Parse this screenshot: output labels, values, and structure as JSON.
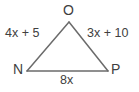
{
  "figure": {
    "type": "triangle-geometry-diagram",
    "stroke_color": "#6b6b6b",
    "text_color": "#404040",
    "background_color": "#ffffff",
    "vertices": [
      {
        "name": "O",
        "label": "O",
        "x": 69,
        "y": 22,
        "position": "apex-top"
      },
      {
        "name": "N",
        "label": "N",
        "x": 27,
        "y": 71,
        "position": "bottom-left"
      },
      {
        "name": "P",
        "label": "P",
        "x": 108,
        "y": 71,
        "position": "bottom-right"
      }
    ],
    "sides": [
      {
        "name": "ON",
        "from": "O",
        "to": "N",
        "label": "4x + 5"
      },
      {
        "name": "OP",
        "from": "O",
        "to": "P",
        "label": "3x + 10"
      },
      {
        "name": "NP",
        "from": "N",
        "to": "P",
        "label": "8x"
      }
    ]
  }
}
